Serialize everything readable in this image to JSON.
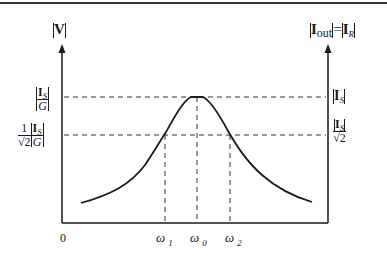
{
  "diagram": {
    "type": "resonance-curve",
    "left_axis": {
      "label": "|V|",
      "label_bold_char": "V"
    },
    "right_axis": {
      "label_left": "I",
      "label_left_sub": "out",
      "equals": "=",
      "label_right": "I",
      "label_right_sub": "R"
    },
    "origin_label": "0",
    "left_ticks": {
      "peak": {
        "num_main": "I",
        "num_sub": "S",
        "den": "G"
      },
      "half_power": {
        "coef_num": "1",
        "coef_den": "√2",
        "num_main": "I",
        "num_sub": "S",
        "den": "G"
      }
    },
    "right_ticks": {
      "peak": {
        "main": "I",
        "sub": "S"
      },
      "half_power": {
        "num_main": "I",
        "num_sub": "S",
        "den": "√2"
      }
    },
    "x_ticks": [
      {
        "symbol": "ω",
        "sub": "1"
      },
      {
        "symbol": "ω",
        "sub": "0"
      },
      {
        "symbol": "ω",
        "sub": "2"
      }
    ],
    "colors": {
      "ink": "#1a1a1a",
      "background": "#ffffff"
    }
  }
}
